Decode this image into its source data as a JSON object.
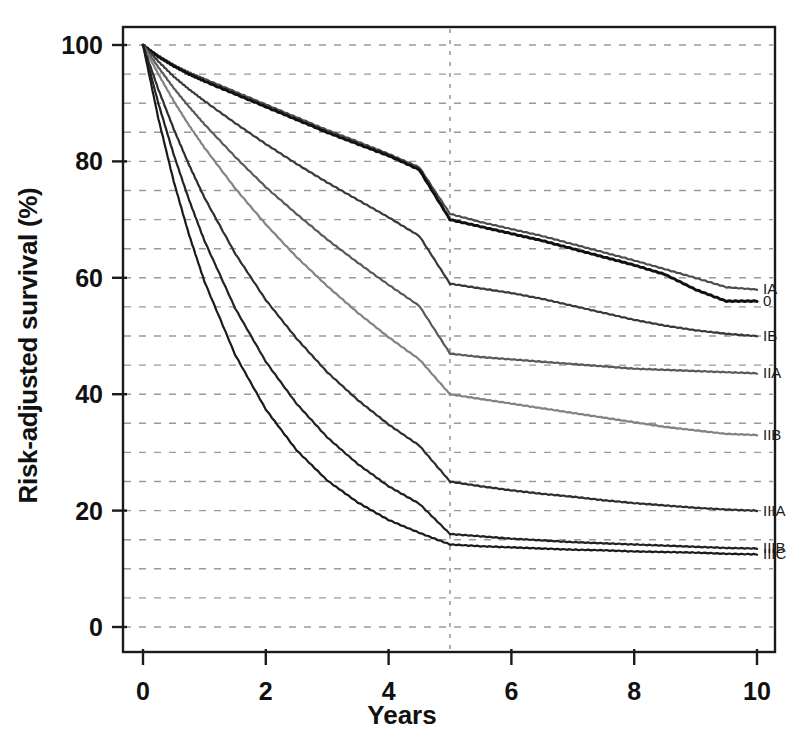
{
  "chart_data": {
    "type": "line",
    "title": "",
    "xlabel": "Years",
    "ylabel": "Risk-adjusted survival (%)",
    "xlim": [
      0,
      10
    ],
    "ylim": [
      0,
      100
    ],
    "xticks": [
      "0",
      "2",
      "4",
      "6",
      "8",
      "10"
    ],
    "xtick_values": [
      0,
      2,
      4,
      6,
      8,
      10
    ],
    "yticks": [
      "0",
      "20",
      "40",
      "60",
      "80",
      "100"
    ],
    "ytick_values": [
      0,
      20,
      40,
      60,
      80,
      100
    ],
    "grid": "horizontal dashed minor every 5 units, vertical dashed minor every 1 year",
    "grid_minor_y_step": 5,
    "grid_minor_x_step": 1,
    "legend_position": "right-inline-at-curve-end",
    "reference_line": {
      "axis": "x",
      "value": 5,
      "style": "dashed"
    },
    "x": [
      0,
      0.25,
      0.5,
      0.75,
      1,
      1.5,
      2,
      2.5,
      3,
      3.5,
      4,
      4.5,
      5,
      5.5,
      6,
      6.5,
      7,
      7.5,
      8,
      8.5,
      9,
      9.5,
      10
    ],
    "series": [
      {
        "name": "IA",
        "label": "IA",
        "color": "#4d4d4d",
        "width": 2.2,
        "five_year": 71,
        "ten_year": 58,
        "values": [
          100,
          98.2,
          96.6,
          95.3,
          94.2,
          92.0,
          89.8,
          87.6,
          85.4,
          83.4,
          81.3,
          79.0,
          71.0,
          69.6,
          68.4,
          67.2,
          65.8,
          64.4,
          63.0,
          61.5,
          60.0,
          58.4,
          58.0
        ]
      },
      {
        "name": "0",
        "label": "0",
        "color": "#111111",
        "width": 3.0,
        "five_year": 70,
        "ten_year": 56,
        "values": [
          100,
          98.0,
          96.4,
          95.0,
          93.8,
          91.6,
          89.4,
          87.2,
          85.0,
          83.0,
          81.0,
          78.6,
          70.0,
          68.8,
          67.6,
          66.4,
          65.0,
          63.6,
          62.2,
          60.6,
          58.0,
          56.0,
          56.0
        ]
      },
      {
        "name": "IB",
        "label": "IB",
        "color": "#3a3a3a",
        "width": 2.2,
        "five_year": 59,
        "ten_year": 50,
        "values": [
          100,
          97.2,
          94.6,
          92.4,
          90.4,
          86.6,
          83.0,
          79.6,
          76.4,
          73.4,
          70.4,
          67.2,
          59.0,
          58.2,
          57.4,
          56.4,
          55.2,
          54.0,
          52.8,
          51.8,
          51.0,
          50.4,
          50.0
        ]
      },
      {
        "name": "IIA",
        "label": "IIA",
        "color": "#5a5a5a",
        "width": 2.2,
        "five_year": 47,
        "ten_year": 44,
        "values": [
          100,
          96.2,
          92.6,
          89.4,
          86.4,
          80.8,
          75.6,
          71.0,
          66.6,
          62.6,
          58.8,
          55.2,
          47.0,
          46.4,
          46.0,
          45.6,
          45.2,
          44.8,
          44.4,
          44.2,
          44.0,
          43.8,
          43.6
        ]
      },
      {
        "name": "IIB",
        "label": "IIB",
        "color": "#838383",
        "width": 2.2,
        "five_year": 40,
        "ten_year": 33,
        "values": [
          100,
          95.0,
          90.4,
          86.2,
          82.4,
          75.4,
          69.2,
          63.6,
          58.6,
          54.0,
          49.8,
          46.0,
          40.0,
          39.2,
          38.4,
          37.6,
          36.8,
          36.0,
          35.2,
          34.4,
          33.8,
          33.2,
          33.0
        ]
      },
      {
        "name": "IIIA",
        "label": "IIIA",
        "color": "#2e2e2e",
        "width": 2.2,
        "five_year": 25,
        "ten_year": 20,
        "values": [
          100,
          92.4,
          85.6,
          79.4,
          73.8,
          64.2,
          56.2,
          49.6,
          43.8,
          39.0,
          34.8,
          31.2,
          25.0,
          24.2,
          23.5,
          22.9,
          22.4,
          21.8,
          21.3,
          20.9,
          20.5,
          20.2,
          20.0
        ]
      },
      {
        "name": "IIIB",
        "label": "IIIB",
        "color": "#222222",
        "width": 2.2,
        "five_year": 16,
        "ten_year": 13.5,
        "values": [
          100,
          90.0,
          81.2,
          73.4,
          66.4,
          54.8,
          45.6,
          38.4,
          32.6,
          28.0,
          24.2,
          21.2,
          16.0,
          15.6,
          15.2,
          14.9,
          14.6,
          14.4,
          14.2,
          14.0,
          13.8,
          13.6,
          13.5
        ]
      },
      {
        "name": "IIIC",
        "label": "IIIC",
        "color": "#1a1a1a",
        "width": 2.2,
        "five_year": 14.2,
        "ten_year": 12.5,
        "values": [
          100,
          87.4,
          76.6,
          67.4,
          59.4,
          46.8,
          37.4,
          30.4,
          25.2,
          21.4,
          18.4,
          16.2,
          14.2,
          13.9,
          13.7,
          13.5,
          13.3,
          13.2,
          13.0,
          12.9,
          12.8,
          12.6,
          12.5
        ]
      }
    ]
  },
  "axes": {
    "x_title": "Years",
    "y_title": "Risk-adjusted survival (%)"
  },
  "colors": {
    "axis": "#1a1a1a",
    "grid": "#9a9a9a",
    "reference": "#8c8c8c",
    "background": "#ffffff"
  }
}
